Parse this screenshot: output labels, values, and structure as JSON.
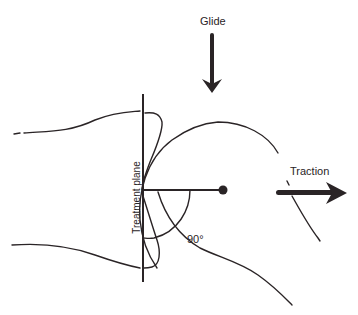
{
  "diagram": {
    "labels": {
      "glide": "Glide",
      "traction": "Traction",
      "treatment_plane": "Treatment plane",
      "angle": "90°"
    },
    "colors": {
      "line": "#2a2426",
      "background": "#ffffff"
    },
    "arrows": [
      {
        "name": "glide",
        "direction": "down"
      },
      {
        "name": "traction",
        "direction": "right"
      }
    ]
  }
}
